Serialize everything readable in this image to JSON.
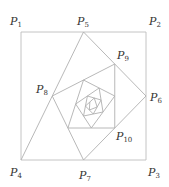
{
  "figure": {
    "square": {
      "P1": [
        21,
        32
      ],
      "P2": [
        146,
        32
      ],
      "P3": [
        146,
        160
      ],
      "P4": [
        21,
        160
      ]
    },
    "spiral_iterations": 22,
    "line_color": "#b0b0b0",
    "labels": [
      {
        "id": "P1",
        "letter": "P",
        "sub": "1",
        "x": 10,
        "y": 25
      },
      {
        "id": "P2",
        "letter": "P",
        "sub": "2",
        "x": 149,
        "y": 25
      },
      {
        "id": "P3",
        "letter": "P",
        "sub": "3",
        "x": 148,
        "y": 176
      },
      {
        "id": "P4",
        "letter": "P",
        "sub": "4",
        "x": 10,
        "y": 176
      },
      {
        "id": "P5",
        "letter": "P",
        "sub": "5",
        "x": 77,
        "y": 25
      },
      {
        "id": "P6",
        "letter": "P",
        "sub": "6",
        "x": 150,
        "y": 101
      },
      {
        "id": "P7",
        "letter": "P",
        "sub": "7",
        "x": 79,
        "y": 179
      },
      {
        "id": "P8",
        "letter": "P",
        "sub": "8",
        "x": 36,
        "y": 93
      },
      {
        "id": "P9",
        "letter": "P",
        "sub": "9",
        "x": 117,
        "y": 59
      },
      {
        "id": "P10",
        "letter": "P",
        "sub": "10",
        "x": 116,
        "y": 140
      }
    ]
  }
}
